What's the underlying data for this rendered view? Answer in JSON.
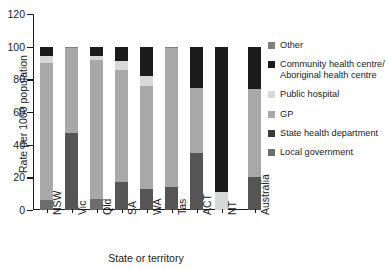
{
  "chart_data": {
    "type": "bar",
    "subtype": "stacked-bar",
    "title": "",
    "xlabel": "State or territory",
    "ylabel": "Rate per 1000 population",
    "ylim": [
      0,
      120
    ],
    "yticks": [
      0,
      20,
      40,
      60,
      80,
      100,
      120
    ],
    "grid": false,
    "legend_position": "right",
    "categories": [
      "NSW",
      "Vic",
      "Qld",
      "SA",
      "WA",
      "Tas",
      "ACT",
      "NT",
      "Australia"
    ],
    "series": [
      {
        "name": "Local government",
        "color": "#6d6d6d",
        "values": [
          6,
          0,
          7,
          0,
          0,
          0,
          0,
          0,
          0
        ]
      },
      {
        "name": "State health department",
        "color": "#555555",
        "values": [
          0,
          47,
          0,
          17,
          13,
          14,
          35,
          0,
          20
        ]
      },
      {
        "name": "GP",
        "color": "#a8a8a8",
        "values": [
          84,
          52,
          85,
          69,
          63,
          85,
          40,
          0,
          54
        ]
      },
      {
        "name": "Public hospital",
        "color": "#d8d8d8",
        "values": [
          4,
          0,
          2,
          5,
          6,
          0,
          0,
          11,
          0
        ]
      },
      {
        "name": "Community health centre/\nAboriginal health centre",
        "color": "#1c1c1c",
        "values": [
          6,
          0,
          6,
          9,
          18,
          0,
          25,
          89,
          26
        ]
      },
      {
        "name": "Other",
        "color": "#808080",
        "values": [
          0,
          1,
          0,
          0,
          0,
          1,
          0,
          0,
          0
        ]
      }
    ],
    "legend_entries": [
      {
        "label": "Other",
        "color": "#808080"
      },
      {
        "label": "Community health centre/\nAboriginal health centre",
        "color": "#1c1c1c"
      },
      {
        "label": "Public hospital",
        "color": "#d8d8d8"
      },
      {
        "label": "GP",
        "color": "#a8a8a8"
      },
      {
        "label": "State health department",
        "color": "#3a3a3a"
      },
      {
        "label": "Local government",
        "color": "#6d6d6d"
      }
    ]
  }
}
